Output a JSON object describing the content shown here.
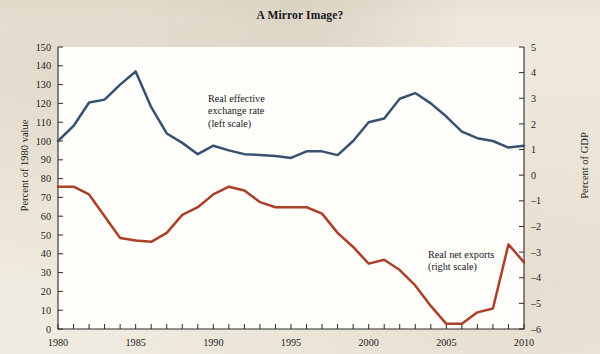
{
  "title": "A Mirror Image?",
  "colors": {
    "blue": "#2f4a6b",
    "red": "#a8381f",
    "axis": "#2a2a2a",
    "page": "#efeade",
    "plot": "#fffefb"
  },
  "axes": {
    "y_left_label": "Percent of 1980 value",
    "y_right_label": "Percent of GDP",
    "x_label": "",
    "y_left_ticks": [
      "0",
      "10",
      "20",
      "30",
      "40",
      "50",
      "60",
      "70",
      "80",
      "90",
      "100",
      "110",
      "120",
      "130",
      "140",
      "150"
    ],
    "y_right_ticks": [
      "-6",
      "-5",
      "-4",
      "-3",
      "-2",
      "-1",
      "0",
      "1",
      "2",
      "3",
      "4",
      "5"
    ],
    "x_ticks": [
      "1980",
      "1985",
      "1990",
      "1995",
      "2000",
      "2005",
      "2010"
    ]
  },
  "annotations": {
    "blue": [
      "Real effective",
      "exchange rate",
      "(left scale)"
    ],
    "red": [
      "Real net exports",
      "(right scale)"
    ]
  },
  "chart_data": {
    "type": "line",
    "title": "A Mirror Image?",
    "xlabel": "",
    "ylabel": "Percent of 1980 value",
    "y2label": "Percent of GDP",
    "xlim": [
      1980,
      2010
    ],
    "ylim": [
      0,
      150
    ],
    "y2lim": [
      -6,
      5
    ],
    "grid": false,
    "legend": "annotations on plot",
    "x": [
      1980,
      1981,
      1982,
      1983,
      1984,
      1985,
      1986,
      1987,
      1988,
      1989,
      1990,
      1991,
      1992,
      1993,
      1994,
      1995,
      1996,
      1997,
      1998,
      1999,
      2000,
      2001,
      2002,
      2003,
      2004,
      2005,
      2006,
      2007,
      2008,
      2009,
      2010
    ],
    "series": [
      {
        "name": "Real effective exchange rate (left scale)",
        "axis": "left",
        "color": "#2f4a6b",
        "units": "Percent of 1980 value",
        "values": [
          100,
          108,
          120.5,
          122,
          130,
          137,
          118,
          104,
          99,
          93,
          97.5,
          95,
          93,
          92.5,
          92,
          91,
          94.5,
          94.5,
          92.5,
          100,
          110,
          112,
          122.5,
          125.5,
          120,
          113,
          105,
          101.5,
          100,
          96.5,
          97.5
        ]
      },
      {
        "name": "Real net exports (right scale)",
        "axis": "right",
        "color": "#a8381f",
        "units": "Percent of GDP",
        "values": [
          -0.45,
          -0.45,
          -0.75,
          -1.6,
          -2.45,
          -2.55,
          -2.6,
          -2.25,
          -1.55,
          -1.25,
          -0.75,
          -0.45,
          -0.6,
          -1.05,
          -1.25,
          -1.25,
          -1.25,
          -1.5,
          -2.25,
          -2.8,
          -3.45,
          -3.3,
          -3.7,
          -4.3,
          -5.1,
          -5.8,
          -5.8,
          -5.35,
          -5.2,
          -2.7,
          -3.4
        ]
      }
    ]
  }
}
